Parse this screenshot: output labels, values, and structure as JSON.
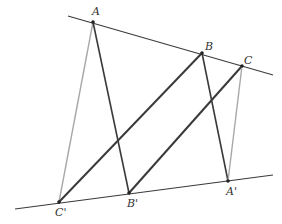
{
  "diagram": {
    "type": "geometry",
    "colors": {
      "line_dark": "#3a3a3a",
      "line_light": "#a8a8a8",
      "point": "#222222",
      "label": "#333333"
    },
    "lines": {
      "upper": {
        "x1": 68,
        "y1": 16,
        "x2": 273,
        "y2": 75
      },
      "lower": {
        "x1": 15,
        "y1": 209,
        "x2": 273,
        "y2": 175
      }
    },
    "points": [
      {
        "name": "A",
        "label": "A",
        "x": 93,
        "y": 22,
        "lx": 92,
        "ly": 15
      },
      {
        "name": "B",
        "label": "B",
        "x": 202,
        "y": 53,
        "lx": 205,
        "ly": 50
      },
      {
        "name": "C",
        "label": "C",
        "x": 242,
        "y": 66,
        "lx": 244,
        "ly": 64
      },
      {
        "name": "C'",
        "label": "C'",
        "x": 59,
        "y": 202,
        "lx": 55,
        "ly": 216
      },
      {
        "name": "B'",
        "label": "B'",
        "x": 129,
        "y": 193,
        "lx": 127,
        "ly": 207
      },
      {
        "name": "A'",
        "label": "A'",
        "x": 228,
        "y": 181,
        "lx": 226,
        "ly": 195
      }
    ],
    "segments": [
      {
        "from": "A",
        "to": "C'",
        "style": "light"
      },
      {
        "from": "A",
        "to": "B'",
        "style": "dark"
      },
      {
        "from": "B",
        "to": "C'",
        "style": "dark-thick"
      },
      {
        "from": "B",
        "to": "A'",
        "style": "dark"
      },
      {
        "from": "C",
        "to": "B'",
        "style": "dark-thick"
      },
      {
        "from": "C",
        "to": "A'",
        "style": "light"
      }
    ]
  }
}
